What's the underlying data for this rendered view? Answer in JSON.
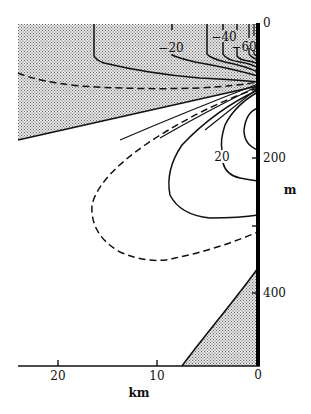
{
  "figure": {
    "x_axis": {
      "title": "km",
      "ticks": [
        {
          "label": "20",
          "value": 20
        },
        {
          "label": "10",
          "value": 10
        },
        {
          "label": "0",
          "value": 0
        }
      ]
    },
    "y_axis": {
      "title": "m",
      "ticks": [
        {
          "label": "0",
          "value": 0
        },
        {
          "label": "200",
          "value": 200
        },
        {
          "label": "",
          "value": 300
        },
        {
          "label": "400",
          "value": 400
        }
      ]
    },
    "contour_labels": [
      {
        "label": "−20"
      },
      {
        "label": "−40"
      },
      {
        "label": "−60"
      },
      {
        "label": "20"
      }
    ],
    "legend_notes": {
      "shaded": "negative region (stippled)",
      "solid": "contour line",
      "dashed": "zero contour"
    },
    "colors": {
      "ink": "#111111",
      "stipple": "#9a9a9a",
      "background": "#ffffff"
    }
  }
}
